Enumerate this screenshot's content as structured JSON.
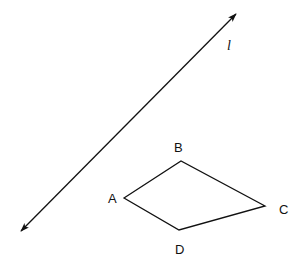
{
  "diagram": {
    "line": {
      "label": "l",
      "start": [
        21,
        231
      ],
      "end": [
        236,
        14
      ],
      "arrows": "both"
    },
    "quadrilateral": {
      "vertices": [
        {
          "name": "A",
          "point": [
            124,
            198
          ],
          "label_pos": [
            113,
            202
          ]
        },
        {
          "name": "B",
          "point": [
            181,
            161
          ],
          "label_pos": [
            178,
            151
          ]
        },
        {
          "name": "C",
          "point": [
            265,
            206
          ],
          "label_pos": [
            284,
            214
          ]
        },
        {
          "name": "D",
          "point": [
            179,
            230
          ],
          "label_pos": [
            180,
            253
          ]
        }
      ]
    },
    "stroke_color": "#111111",
    "background": "#ffffff"
  }
}
